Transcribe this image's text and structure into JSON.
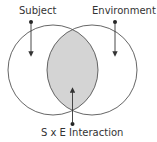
{
  "diagram": {
    "type": "venn",
    "labels": {
      "subject": "Subject",
      "environment": "Environment",
      "interaction": "S x E Interaction"
    },
    "sets": [
      {
        "name": "Subject",
        "cx": 53,
        "cy": 70,
        "r": 45
      },
      {
        "name": "Environment",
        "cx": 92,
        "cy": 70,
        "r": 45
      }
    ],
    "intersection": {
      "name": "S x E Interaction",
      "fill": "#d4d4d4"
    },
    "colors": {
      "stroke": "#555555",
      "text": "#333333",
      "overlap_fill": "#d4d4d4",
      "background": "#ffffff"
    }
  }
}
